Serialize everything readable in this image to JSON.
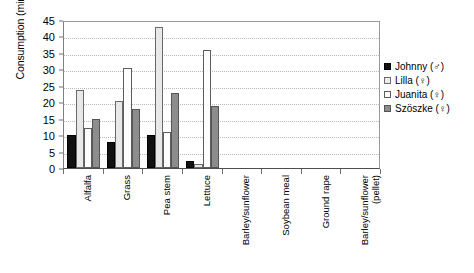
{
  "chart_data": {
    "type": "bar",
    "title": "",
    "xlabel": "",
    "ylabel": "Consumption (min)",
    "ylim": [
      0,
      45
    ],
    "ytick_step": 5,
    "yticks": [
      "0",
      "5",
      "10",
      "15",
      "20",
      "25",
      "30",
      "35",
      "40",
      "45"
    ],
    "grid": true,
    "legend_position": "right",
    "categories": [
      "Alfalfa",
      "Grass",
      "Pea stem",
      "Lettuce",
      "Barley/sunflower",
      "Soybean meal",
      "Ground rape",
      "Barley/sunflower\n(pellet)"
    ],
    "series": [
      {
        "name": "Johnny (♂)",
        "color": "#111111",
        "values": [
          10,
          8,
          10,
          2,
          0,
          0,
          0,
          0
        ]
      },
      {
        "name": "Lilla (♀)",
        "color": "#e8e8e8",
        "values": [
          23.7,
          20.3,
          43,
          1.2,
          0,
          0,
          0,
          0
        ]
      },
      {
        "name": "Juanita (♀)",
        "color": "#fdfdfd",
        "values": [
          12.2,
          30.3,
          10.8,
          35.8,
          0,
          0,
          0,
          0
        ]
      },
      {
        "name": "Szöszke (♀)",
        "color": "#8d8d8d",
        "values": [
          15,
          17.8,
          22.8,
          18.8,
          0,
          0,
          0,
          0
        ]
      }
    ]
  },
  "legend": {
    "items": [
      {
        "label": "Johnny (♂)"
      },
      {
        "label": "Lilla (♀)"
      },
      {
        "label": "Juanita (♀)"
      },
      {
        "label": "Szöszke (♀)"
      }
    ]
  }
}
